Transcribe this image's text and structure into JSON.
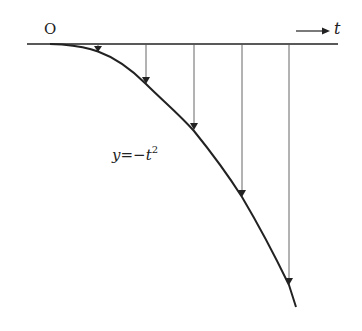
{
  "diagram": {
    "origin_label": "O",
    "axis_label": "t",
    "curve_label": {
      "lhs": "y",
      "eq": "=",
      "rhs": "−t",
      "exp": "2"
    },
    "colors": {
      "axis": "#222222",
      "curve": "#222222",
      "arrows": "#555555"
    },
    "arrow_x_positions": [
      98,
      146,
      194,
      242,
      289
    ],
    "arrow_count": 5
  }
}
